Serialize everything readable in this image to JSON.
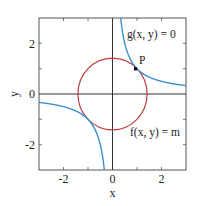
{
  "chart_data": {
    "type": "line",
    "title": "",
    "xlabel": "x",
    "ylabel": "y",
    "xlim": [
      -3,
      3
    ],
    "ylim": [
      -3,
      3
    ],
    "xticks": [
      -2,
      0,
      2
    ],
    "yticks": [
      -2,
      0,
      2
    ],
    "xtick_labels": [
      "-2",
      "0",
      "2"
    ],
    "ytick_labels": [
      "-2",
      "0",
      "2"
    ],
    "grid": false,
    "series": [
      {
        "name": "g(x, y) = 0",
        "kind": "hyperbola",
        "equation": "y = 1/x",
        "color": "#3a8fd0"
      },
      {
        "name": "f(x, y) = m",
        "kind": "circle",
        "equation": "x^2 + y^2 = 2",
        "radius": 1.414,
        "color": "#c0393b"
      }
    ],
    "points": [
      {
        "label": "P",
        "x": 1,
        "y": 1
      }
    ],
    "annotations": [
      {
        "text": "g(x, y) = 0",
        "x": 1.85,
        "y": 2.05
      },
      {
        "text": "f(x, y) = m",
        "x": 1.85,
        "y": -1.45
      },
      {
        "text": "P",
        "x": 1.15,
        "y": 1.15
      }
    ]
  },
  "labels": {
    "xlabel": "x",
    "ylabel": "y",
    "xticks": [
      "-2",
      "0",
      "2"
    ],
    "yticks": [
      "2",
      "0",
      "-2"
    ],
    "curve_g": "g(x, y) = 0",
    "curve_f": "f(x, y) = m",
    "point": "P"
  },
  "colors": {
    "hyperbola": "#3a8fd0",
    "circle": "#c0393b",
    "axis": "#333333",
    "frame": "#555555"
  }
}
